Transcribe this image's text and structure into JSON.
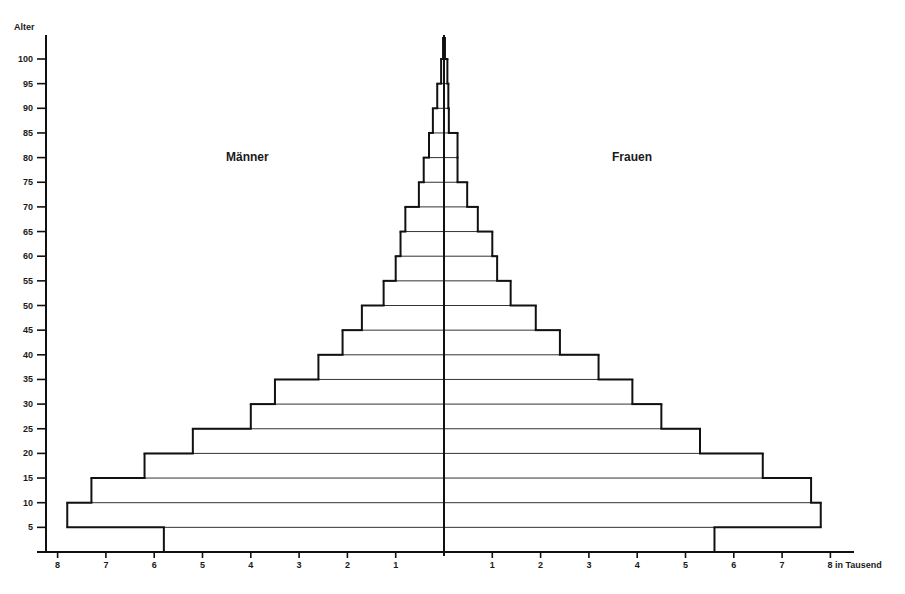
{
  "chart_data": {
    "type": "bar",
    "subtype": "population-pyramid",
    "title": "",
    "ylabel": "Alter",
    "xlabel": "in Tausend",
    "x_unit_label": "8 in Tausend",
    "ylim": [
      0,
      100
    ],
    "xlim": [
      -8,
      8
    ],
    "grid": false,
    "legend_position": "none",
    "side_labels": {
      "left": "Männer",
      "right": "Frauen"
    },
    "y_ticks": [
      5,
      10,
      15,
      20,
      25,
      30,
      35,
      40,
      45,
      50,
      55,
      60,
      65,
      70,
      75,
      80,
      85,
      90,
      95,
      100
    ],
    "x_ticks_left": [
      8,
      7,
      6,
      5,
      4,
      3,
      2,
      1
    ],
    "x_ticks_right": [
      1,
      2,
      3,
      4,
      5,
      6,
      7,
      8
    ],
    "categories": [
      "0-5",
      "5-10",
      "10-15",
      "15-20",
      "20-25",
      "25-30",
      "30-35",
      "35-40",
      "40-45",
      "45-50",
      "50-55",
      "55-60",
      "60-65",
      "65-70",
      "70-75",
      "75-80",
      "80-85",
      "85-90",
      "90-95",
      "95-100",
      "100+"
    ],
    "series": [
      {
        "name": "Männer",
        "values": [
          5.8,
          7.8,
          7.3,
          6.2,
          5.2,
          4.0,
          3.5,
          2.6,
          2.1,
          1.7,
          1.25,
          1.0,
          0.9,
          0.8,
          0.52,
          0.42,
          0.31,
          0.23,
          0.14,
          0.06,
          0.02
        ]
      },
      {
        "name": "Frauen",
        "values": [
          5.6,
          7.8,
          7.6,
          6.6,
          5.3,
          4.5,
          3.9,
          3.2,
          2.4,
          1.9,
          1.38,
          1.1,
          1.0,
          0.7,
          0.48,
          0.28,
          0.28,
          0.1,
          0.09,
          0.07,
          0.02
        ]
      }
    ]
  },
  "labels": {
    "y_axis_title": "Alter",
    "left_group": "Männer",
    "right_group": "Frauen",
    "x_unit": "in Tausend"
  }
}
